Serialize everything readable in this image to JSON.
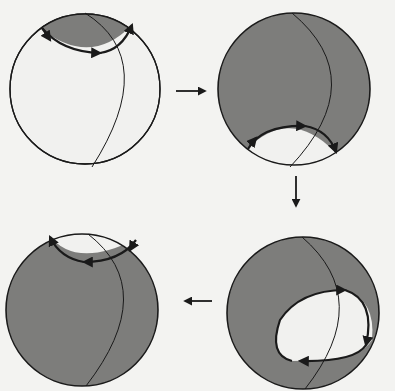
{
  "diagram": {
    "type": "sphere-deformation-sequence",
    "panel_count": 4,
    "order": [
      "top-left",
      "top-right",
      "bottom-right",
      "bottom-left"
    ],
    "colors": {
      "background": "#f3f3f1",
      "sphere_fill_light": "#f1f1ef",
      "shaded_region": "#7d7d7b",
      "outline": "#1a1a1a"
    },
    "panels": [
      {
        "id": "panel-1",
        "position": "top-left",
        "shading": "small cap shaded at top",
        "loop": "arc along cap boundary with arrows"
      },
      {
        "id": "panel-2",
        "position": "top-right",
        "shading": "most of sphere shaded, small cap unshaded at bottom",
        "loop": "arc near bottom with arrows"
      },
      {
        "id": "panel-3",
        "position": "bottom-right",
        "shading": "sphere shaded with unshaded oval region lower right",
        "loop": "closed oval loop with arrows"
      },
      {
        "id": "panel-4",
        "position": "bottom-left",
        "shading": "sphere shaded, small cap unshaded at top",
        "loop": "arc near top with arrows"
      }
    ],
    "transitions": [
      {
        "from": "panel-1",
        "to": "panel-2",
        "direction": "right"
      },
      {
        "from": "panel-2",
        "to": "panel-3",
        "direction": "down"
      },
      {
        "from": "panel-3",
        "to": "panel-4",
        "direction": "left"
      }
    ]
  }
}
